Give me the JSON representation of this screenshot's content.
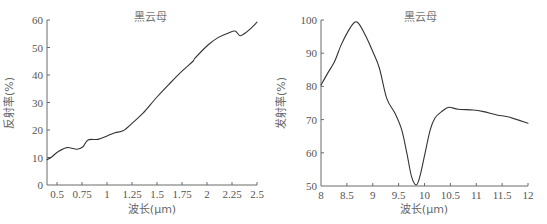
{
  "chart_data": [
    {
      "type": "line",
      "title": "黑云母",
      "xlabel": "波长(μm)",
      "ylabel": "反射率(%)",
      "xlim": [
        0.4,
        2.5
      ],
      "ylim": [
        0,
        60
      ],
      "xticks": [
        0.5,
        0.75,
        1,
        1.25,
        1.5,
        1.75,
        2,
        2.25,
        2.5
      ],
      "xtick_labels": [
        "0.5",
        "0.75",
        "1",
        "1.25",
        "1.5",
        "1.75",
        "2",
        "2.25",
        "2.5"
      ],
      "yticks": [
        0,
        10,
        20,
        30,
        40,
        50,
        60
      ],
      "ytick_labels": [
        "0",
        "10",
        "20",
        "30",
        "40",
        "50",
        "60"
      ],
      "grid": false,
      "legend": null,
      "series": [
        {
          "name": "黑云母",
          "x": [
            0.4,
            0.45,
            0.51,
            0.6,
            0.7,
            0.76,
            0.81,
            0.91,
            1.0,
            1.08,
            1.16,
            1.25,
            1.36,
            1.5,
            1.63,
            1.75,
            1.86,
            1.88,
            2.01,
            2.11,
            2.21,
            2.28,
            2.33,
            2.38,
            2.43,
            2.5
          ],
          "y": [
            9.2,
            10.3,
            12.1,
            13.6,
            13.0,
            13.9,
            16.4,
            16.6,
            17.8,
            19.0,
            19.7,
            22.4,
            26.1,
            32.0,
            37.0,
            41.4,
            45.0,
            46.1,
            50.9,
            53.6,
            55.2,
            56.0,
            54.3,
            55.2,
            56.7,
            59.2
          ]
        }
      ]
    },
    {
      "type": "line",
      "title": "黑云母",
      "xlabel": "波长(μm)",
      "ylabel": "发射率(%)",
      "xlim": [
        8,
        12
      ],
      "ylim": [
        50,
        100
      ],
      "xticks": [
        8,
        8.5,
        9,
        9.5,
        10,
        10.5,
        11,
        11.5,
        12
      ],
      "xtick_labels": [
        "8",
        "8.5",
        "9",
        "9.5",
        "10",
        "10.5",
        "11",
        "11.5",
        "12"
      ],
      "yticks": [
        50,
        60,
        70,
        80,
        90,
        100
      ],
      "ytick_labels": [
        "50",
        "60",
        "70",
        "80",
        "90",
        "100"
      ],
      "grid": false,
      "legend": null,
      "series": [
        {
          "name": "黑云母",
          "x": [
            8.0,
            8.13,
            8.26,
            8.39,
            8.52,
            8.65,
            8.74,
            8.87,
            9.0,
            9.13,
            9.27,
            9.43,
            9.56,
            9.66,
            9.75,
            9.84,
            9.91,
            10.01,
            10.11,
            10.2,
            10.33,
            10.47,
            10.65,
            10.94,
            11.14,
            11.4,
            11.65,
            12.0
          ],
          "y": [
            80.4,
            84.0,
            87.4,
            92.5,
            96.5,
            99.3,
            98.7,
            95.0,
            90.5,
            85.4,
            76.4,
            71.9,
            66.9,
            59.8,
            52.8,
            50.3,
            52.8,
            59.8,
            66.9,
            70.4,
            72.4,
            73.7,
            73.1,
            72.9,
            72.4,
            71.4,
            70.7,
            68.9
          ]
        }
      ]
    }
  ],
  "layout": {
    "panels": [
      {
        "px": [
          47,
          257
        ],
        "py": [
          185,
          20
        ],
        "title_pos": [
          150,
          21
        ],
        "ylabel_pos": [
          13,
          103
        ],
        "xlabel_pos": [
          152,
          213
        ]
      },
      {
        "px": [
          321,
          528
        ],
        "py": [
          186,
          20
        ],
        "title_pos": [
          420,
          21
        ],
        "ylabel_pos": [
          285,
          103
        ],
        "xlabel_pos": [
          424,
          213
        ]
      }
    ]
  },
  "colors": {
    "line": "#333333",
    "axis": "#6a6a6a",
    "text": "#555555"
  }
}
